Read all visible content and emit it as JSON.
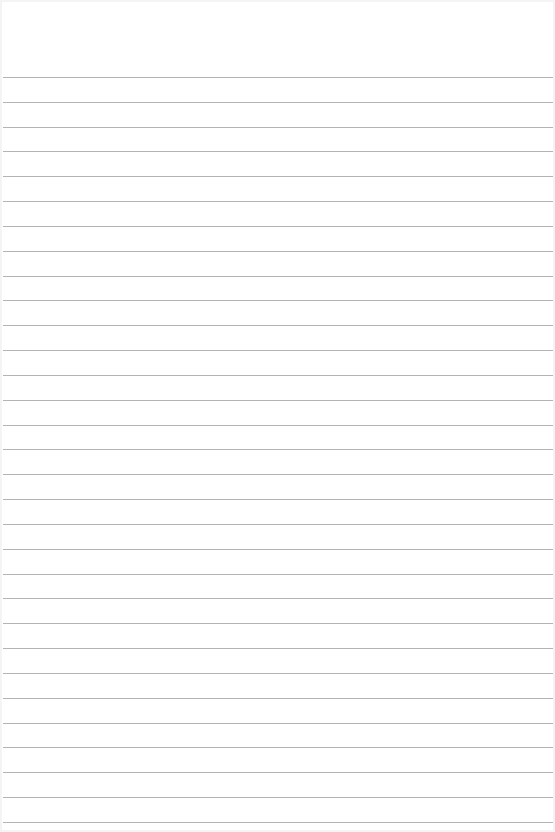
{
  "document": {
    "type": "lined-paper",
    "background_color": "#ffffff",
    "line_color": "#b4b4b4",
    "line_count": 31,
    "first_line_y": 77,
    "line_spacing": 24.83,
    "text": ""
  }
}
